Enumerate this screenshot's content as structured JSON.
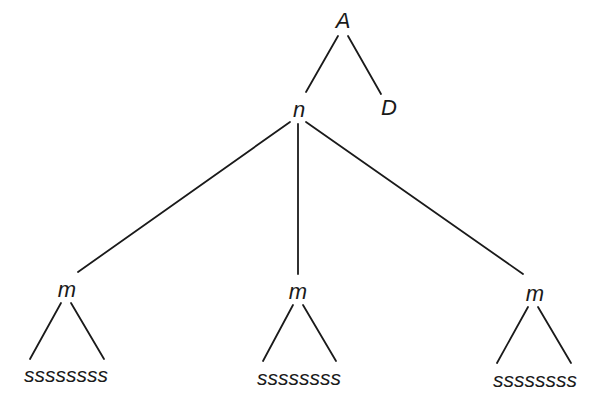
{
  "diagram": {
    "type": "tree",
    "root": {
      "label": "A",
      "children": [
        {
          "label": "n",
          "children": [
            {
              "label": "m",
              "children": [
                {
                  "label": "ssssssss"
                }
              ]
            },
            {
              "label": "m",
              "children": [
                {
                  "label": "ssssssss"
                }
              ]
            },
            {
              "label": "m",
              "children": [
                {
                  "label": "ssssssss"
                }
              ]
            }
          ]
        },
        {
          "label": "D"
        }
      ]
    },
    "nodes": {
      "A": "A",
      "n": "n",
      "D": "D",
      "m1": "m",
      "m2": "m",
      "m3": "m",
      "leaf1": "ssssssss",
      "leaf2": "ssssssss",
      "leaf3": "ssssssss"
    },
    "colors": {
      "line": "#1a1a1a",
      "text": "#1a1a1a",
      "background": "#ffffff"
    }
  }
}
